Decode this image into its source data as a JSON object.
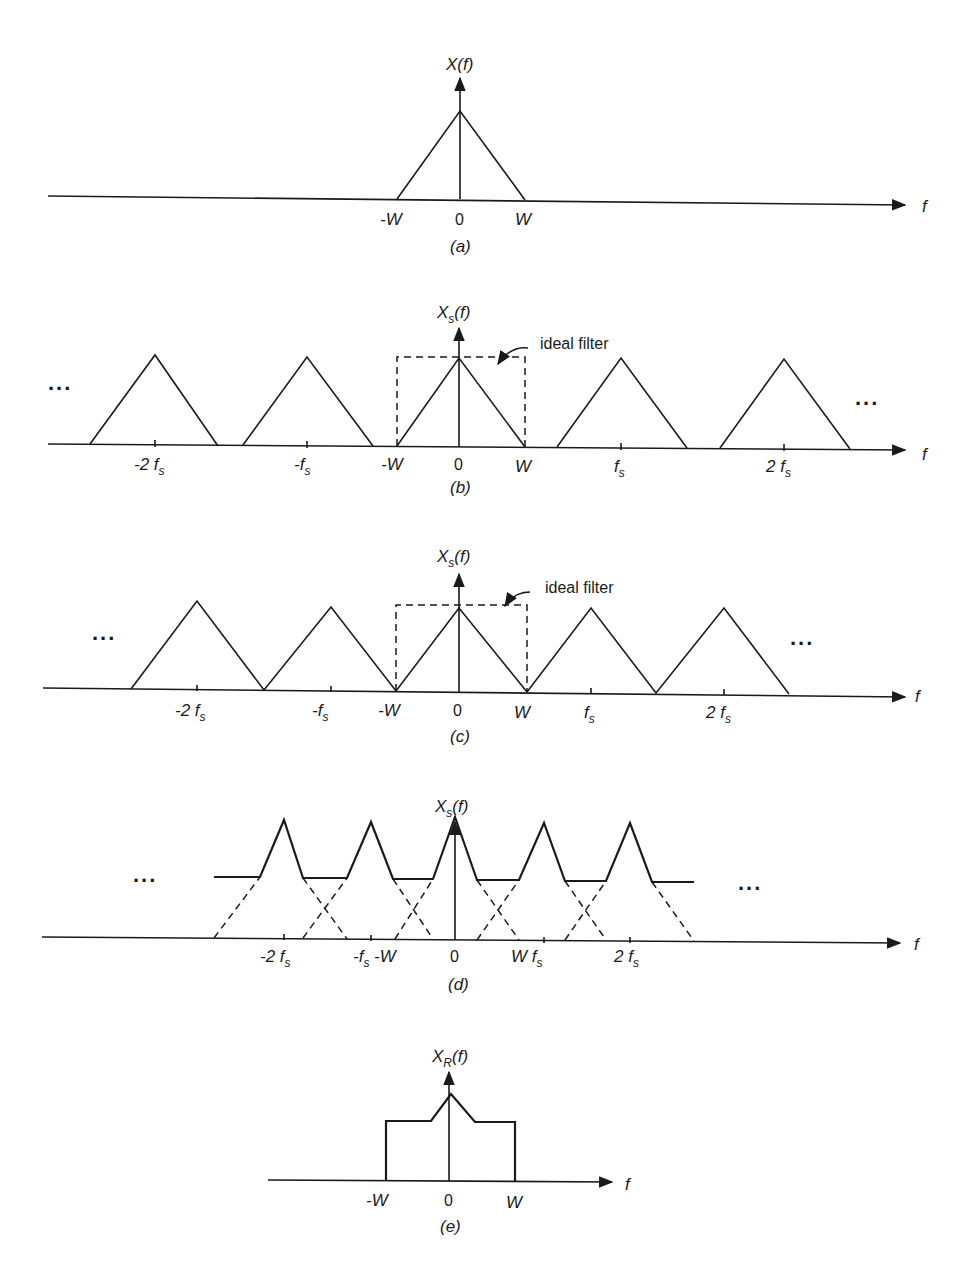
{
  "figure": {
    "panels": [
      {
        "id": "a",
        "caption": "(a)",
        "ylabel": "X(f)",
        "xlabel": "f",
        "ticks": [
          "-W",
          "0",
          "W"
        ],
        "axis_y": 197,
        "tick_x": [
          397,
          460,
          525
        ],
        "triangles": [
          {
            "left": 397,
            "center": 460,
            "right": 525,
            "apex_y": 110
          }
        ]
      },
      {
        "id": "b",
        "caption": "(b)",
        "ylabel": "Xs(f)",
        "ylabel_main": "X",
        "ylabel_sub": "s",
        "ylabel_tail": "(f)",
        "xlabel": "f",
        "annotation": "ideal filter",
        "ellipsis_left": "...",
        "ellipsis_right": "...",
        "ticks": [
          "-2 fs",
          "-fs",
          "-W",
          "0",
          "W",
          "fs",
          "2 fs"
        ],
        "axis_y": 445,
        "triangles": [
          {
            "left": 90,
            "center": 155,
            "right": 218,
            "apex_y": 355
          },
          {
            "left": 243,
            "center": 307,
            "right": 373,
            "apex_y": 357
          },
          {
            "left": 397,
            "center": 459,
            "right": 525,
            "apex_y": 358
          },
          {
            "left": 557,
            "center": 621,
            "right": 687,
            "apex_y": 358
          },
          {
            "left": 720,
            "center": 784,
            "right": 850,
            "apex_y": 358
          }
        ],
        "filter": {
          "left": 397,
          "right": 525,
          "top": 357
        }
      },
      {
        "id": "c",
        "caption": "(c)",
        "ylabel_main": "X",
        "ylabel_sub": "s",
        "ylabel_tail": "(f)",
        "xlabel": "f",
        "annotation": "ideal filter",
        "ellipsis_left": "...",
        "ellipsis_right": "...",
        "ticks": [
          "-2 fs",
          "-fs",
          "-W",
          "0",
          "W",
          "fs",
          "2 fs"
        ],
        "axis_y": 690,
        "triangles": [
          {
            "left": 131,
            "center": 197,
            "right": 264,
            "apex_y": 601
          },
          {
            "left": 264,
            "center": 331,
            "right": 396,
            "apex_y": 607
          },
          {
            "left": 396,
            "center": 459,
            "right": 527,
            "apex_y": 608
          },
          {
            "left": 527,
            "center": 591,
            "right": 656,
            "apex_y": 608
          },
          {
            "left": 656,
            "center": 724,
            "right": 789,
            "apex_y": 608
          }
        ],
        "filter": {
          "left": 396,
          "right": 527,
          "top": 605
        }
      },
      {
        "id": "d",
        "caption": "(d)",
        "ylabel_main": "X",
        "ylabel_sub": "s",
        "ylabel_tail": "(f)",
        "xlabel": "f",
        "ellipsis_left": "...",
        "ellipsis_right": "...",
        "ticks": [
          "-2 fs",
          "-fs",
          "-W",
          "0",
          "W",
          "fs",
          "2 fs"
        ],
        "axis_y": 940,
        "centers": [
          284,
          371,
          455,
          544,
          634
        ],
        "peak_y": 818,
        "plateau_y": 879
      },
      {
        "id": "e",
        "caption": "(e)",
        "ylabel_main": "X",
        "ylabel_sub": "R",
        "ylabel_tail": "(f)",
        "xlabel": "f",
        "ticks": [
          "-W",
          "0",
          "W"
        ],
        "axis_y": 1181,
        "tick_x": [
          386,
          449,
          515
        ],
        "plateau_y": 1122,
        "peak_y": 1093
      }
    ]
  }
}
